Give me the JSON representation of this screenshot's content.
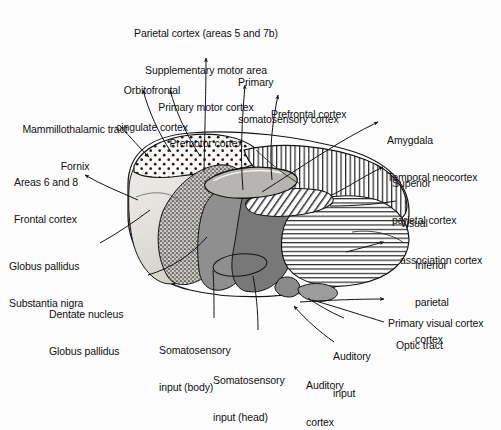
{
  "figure": {
    "type": "anatomical-diagram",
    "background_color": "#fdfdfd",
    "ink_color": "#141414"
  },
  "labels": {
    "top_block": {
      "line1": "Parietal cortex (areas 5 and 7b)",
      "line2": "Supplementary motor area",
      "line3": "Primary motor cortex",
      "line4": "Premotor cortex"
    },
    "orbitofrontal": {
      "line1": "Orbitofrontal",
      "line2": "cingulate cortex"
    },
    "primary_somatosensory": {
      "line1": "Primary",
      "line2": "somatosensory cortex"
    },
    "prefrontal": {
      "line1": "Prefrontal cortex"
    },
    "mammillothalamic": {
      "line1": "Mammillothalamic tract",
      "line2": "Fornix"
    },
    "areas_6_8": {
      "line1": "Areas 6 and 8",
      "line2": "Frontal cortex"
    },
    "amygdala": {
      "line1": "Amygdala",
      "line2": "Temporal neocortex"
    },
    "superior_parietal": {
      "line1": "Superior",
      "line2": "parietal cortex"
    },
    "visual_association": {
      "line1": "Visual",
      "line2": "association cortex"
    },
    "inferior_parietal": {
      "line1": "Inferior",
      "line2": "parietal",
      "line3": "cortex"
    },
    "globus_pallidus_sn": {
      "line1": "Globus pallidus",
      "line2": "Substantia nigra"
    },
    "dentate_nucleus": {
      "line1": "Dentate nucleus",
      "line2": "Globus pallidus"
    },
    "somatosensory_body": {
      "line1": "Somatosensory",
      "line2": "input (body)"
    },
    "somatosensory_head": {
      "line1": "Somatosensory",
      "line2": "input (head)"
    },
    "primary_visual": {
      "line1": "Primary visual cortex"
    },
    "optic_tract": {
      "line1": "Optic tract"
    },
    "auditory_input": {
      "line1": "Auditory",
      "line2": "input"
    },
    "auditory_cortex": {
      "line1": "Auditory",
      "line2": "cortex"
    }
  },
  "regions": [
    {
      "name": "anterior-nucleus-stippled",
      "pattern": "coarse-dots",
      "fill": "#f7f5f2"
    },
    {
      "name": "medial-dorsal-nucleus",
      "pattern": "smooth-gray",
      "fill": "#e6e4e0"
    },
    {
      "name": "ventral-anterior-nucleus",
      "pattern": "fine-stipple",
      "fill": "#bdbab5"
    },
    {
      "name": "ventral-lateral-nucleus",
      "pattern": "solid-dark-gray",
      "fill": "#8d8d8d"
    },
    {
      "name": "ventral-posterior-nucleus",
      "pattern": "solid-mid-gray",
      "fill": "#7a7a7a"
    },
    {
      "name": "lateral-posterior-nucleus",
      "pattern": "vertical-hatch",
      "fill": "#ffffff"
    },
    {
      "name": "pulvinar",
      "pattern": "horizontal-hatch",
      "fill": "#ffffff"
    },
    {
      "name": "lateral-geniculate-body",
      "pattern": "solid-gray",
      "fill": "#9a9a9a"
    },
    {
      "name": "medial-geniculate-body",
      "pattern": "solid-gray",
      "fill": "#8f8f8f"
    },
    {
      "name": "internal-medullary-lamina",
      "pattern": "diagonal-hatch",
      "fill": "#ffffff"
    }
  ]
}
